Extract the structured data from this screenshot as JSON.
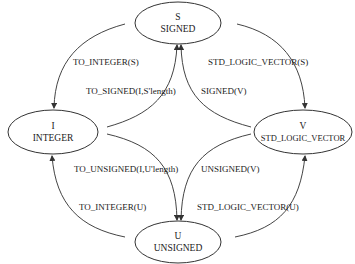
{
  "nodes": {
    "signed": {
      "letter": "S",
      "name": "SIGNED"
    },
    "integer": {
      "letter": "I",
      "name": "INTEGER"
    },
    "slv": {
      "letter": "V",
      "name": "STD_LOGIC_VECTOR"
    },
    "unsigned": {
      "letter": "U",
      "name": "UNSIGNED"
    }
  },
  "edges": {
    "s_to_i": "TO_INTEGER(S)",
    "i_to_s": "TO_SIGNED(I,S'length)",
    "s_to_v": "STD_LOGIC_VECTOR(S)",
    "v_to_s": "SIGNED(V)",
    "i_to_u": "TO_UNSIGNED(I,U'length)",
    "u_to_i": "TO_INTEGER(U)",
    "v_to_u": "UNSIGNED(V)",
    "u_to_v": "STD_LOGIC_VECTOR(U)"
  },
  "colors": {
    "stroke": "#333333",
    "text": "#222222",
    "background": "#ffffff"
  }
}
